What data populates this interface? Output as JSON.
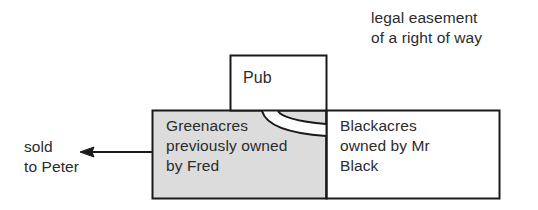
{
  "diagram": {
    "type": "property-easement-diagram",
    "annotations": {
      "easement": "legal easement\nof a right of way",
      "sale": "sold\nto Peter"
    },
    "parcels": [
      {
        "id": "pub",
        "label": "Pub",
        "fill": "#ffffff",
        "stroke": "#1a1a1a"
      },
      {
        "id": "greenacres",
        "label": "Greenacres\npreviously owned\nby Fred",
        "fill": "#dcdcdc",
        "stroke": "#1a1a1a"
      },
      {
        "id": "blackacres",
        "label": "Blackacres\nowned by Mr\nBlack",
        "fill": "#ffffff",
        "stroke": "#1a1a1a"
      }
    ],
    "arrow": {
      "direction": "left",
      "from_x": 152,
      "to_x": 80,
      "y": 152
    },
    "right_of_way": {
      "description": "curved track across Greenacres from Pub to Blackacres boundary",
      "stroke": "#1a1a1a"
    },
    "colors": {
      "text": "#2b2b2b",
      "line": "#1a1a1a",
      "shaded_fill": "#dcdcdc",
      "plain_fill": "#ffffff",
      "background": "#ffffff"
    }
  }
}
